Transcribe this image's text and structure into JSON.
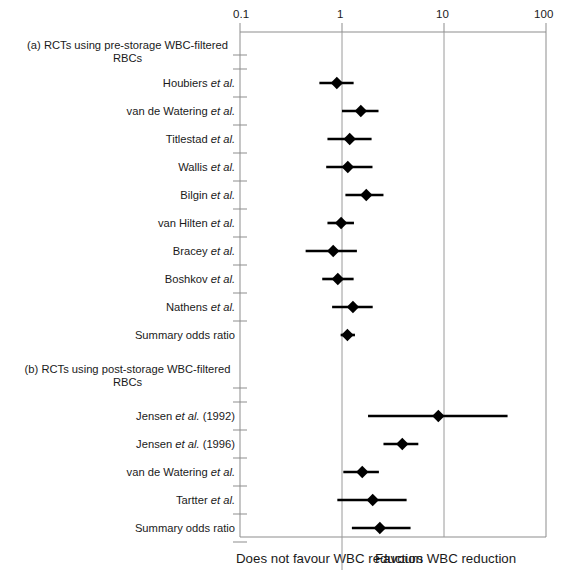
{
  "figure": {
    "panel_a_heading": "(a) RCTs using pre-storage WBC-filtered RBCs",
    "panel_b_heading": "(b) RCTs using post-storage WBC-filtered RBCs",
    "left_caption": "Does not favour WBC reduction",
    "right_caption": "Favours WBC reduction"
  },
  "axis": {
    "scale": "log10",
    "ticks": [
      "0.1",
      "1",
      "10",
      "100"
    ],
    "tick_values": [
      0.1,
      1,
      10,
      100
    ],
    "reference_line": "1"
  },
  "chart_data": {
    "type": "forest",
    "title": "",
    "xlabel": "Odds ratio",
    "ylabel": "",
    "xscale": "log",
    "xlim": [
      0.1,
      100
    ],
    "xticks": [
      0.1,
      1,
      10,
      100
    ],
    "xticklabels": [
      "0.1",
      "1",
      "10",
      "100"
    ],
    "grid": false,
    "reference_line_x": 1,
    "legend": "none",
    "annotations": [
      "Does not favour WBC reduction",
      "Favours WBC reduction"
    ],
    "panels": [
      {
        "id": "a",
        "label": "(a) RCTs using pre-storage WBC-filtered RBCs",
        "rows": [
          {
            "label": "Houbiers et al.",
            "italic": "et al.",
            "or": 0.89,
            "ci_low": 0.6,
            "ci_high": 1.3,
            "summary": false
          },
          {
            "label": "van de Watering et al.",
            "italic": "et al.",
            "or": 1.53,
            "ci_low": 1.0,
            "ci_high": 2.28,
            "summary": false
          },
          {
            "label": "Titlestad et al.",
            "italic": "et al.",
            "or": 1.19,
            "ci_low": 0.72,
            "ci_high": 1.95,
            "summary": false
          },
          {
            "label": "Wallis et al.",
            "italic": "et al.",
            "or": 1.14,
            "ci_low": 0.7,
            "ci_high": 1.99,
            "summary": false
          },
          {
            "label": "Bilgin et al.",
            "italic": "et al.",
            "or": 1.73,
            "ci_low": 1.08,
            "ci_high": 2.55,
            "summary": false
          },
          {
            "label": "van Hilten et al.",
            "italic": "et al.",
            "or": 0.98,
            "ci_low": 0.72,
            "ci_high": 1.31,
            "summary": false
          },
          {
            "label": "Bracey et al.",
            "italic": "et al.",
            "or": 0.82,
            "ci_low": 0.44,
            "ci_high": 1.4,
            "summary": false
          },
          {
            "label": "Boshkov et al.",
            "italic": "et al.",
            "or": 0.91,
            "ci_low": 0.64,
            "ci_high": 1.3,
            "summary": false
          },
          {
            "label": "Nathens et al.",
            "italic": "et al.",
            "or": 1.28,
            "ci_low": 0.8,
            "ci_high": 2.0,
            "summary": false
          },
          {
            "label": "Summary odds ratio",
            "italic": "",
            "or": 1.13,
            "ci_low": 0.97,
            "ci_high": 1.34,
            "summary": true
          }
        ]
      },
      {
        "id": "b",
        "label": "(b) RCTs using post-storage WBC-filtered RBCs",
        "rows": [
          {
            "label": "Jensen et al. (1992)",
            "italic": "et al.",
            "or": 8.8,
            "ci_low": 1.8,
            "ci_high": 42.0,
            "summary": false
          },
          {
            "label": "Jensen et al. (1996)",
            "italic": "et al.",
            "or": 3.9,
            "ci_low": 2.55,
            "ci_high": 5.6,
            "summary": false
          },
          {
            "label": "van de Watering et al.",
            "italic": "et al.",
            "or": 1.58,
            "ci_low": 1.03,
            "ci_high": 2.3,
            "summary": false
          },
          {
            "label": "Tartter et al.",
            "italic": "et al.",
            "or": 2.0,
            "ci_low": 0.9,
            "ci_high": 4.3,
            "summary": false
          },
          {
            "label": "Summary odds ratio",
            "italic": "",
            "or": 2.35,
            "ci_low": 1.25,
            "ci_high": 4.7,
            "summary": true
          }
        ]
      }
    ]
  }
}
